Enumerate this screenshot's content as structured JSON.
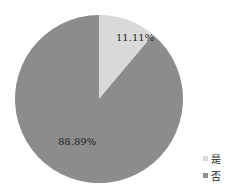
{
  "chart_data": {
    "type": "pie",
    "title": "",
    "categories": [
      "是",
      "否"
    ],
    "values": [
      11.11,
      88.89
    ],
    "labels": [
      "11.11%",
      "88.89%"
    ],
    "colors": [
      "#d9d9d9",
      "#8c8c8c"
    ],
    "legend_position": "right-bottom"
  },
  "legend": {
    "items": [
      {
        "label": "是",
        "color": "#d9d9d9"
      },
      {
        "label": "否",
        "color": "#8c8c8c"
      }
    ]
  }
}
